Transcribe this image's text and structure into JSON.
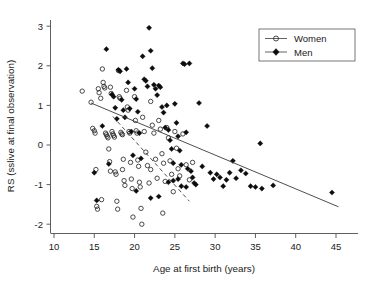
{
  "chart_data": {
    "type": "scatter",
    "title": "",
    "xlabel": "Age at first birth (years)",
    "ylabel": "RS (sslive at final observation)",
    "xlim": [
      9,
      47
    ],
    "ylim": [
      -2.35,
      3.2
    ],
    "xticks": [
      10,
      15,
      20,
      25,
      30,
      35,
      40,
      45
    ],
    "yticks": [
      -2,
      -1,
      0,
      1,
      2,
      3
    ],
    "grid": false,
    "legend_position": "top-right",
    "legend": [
      {
        "name": "Women",
        "marker": "open-circle"
      },
      {
        "name": "Men",
        "marker": "filled-diamond"
      }
    ],
    "series": [
      {
        "name": "Women",
        "marker": "open-circle",
        "points": [
          [
            13.5,
            1.36
          ],
          [
            14.6,
            1.08
          ],
          [
            14.8,
            0.42
          ],
          [
            15.0,
            0.36
          ],
          [
            15.1,
            0.3
          ],
          [
            15.2,
            -0.62
          ],
          [
            15.3,
            -1.55
          ],
          [
            15.4,
            -1.62
          ],
          [
            15.5,
            1.42
          ],
          [
            15.6,
            1.32
          ],
          [
            15.8,
            1.18
          ],
          [
            15.9,
            -1.38
          ],
          [
            16.0,
            1.92
          ],
          [
            16.1,
            1.58
          ],
          [
            16.2,
            1.48
          ],
          [
            16.3,
            1.44
          ],
          [
            16.4,
            0.3
          ],
          [
            16.5,
            0.26
          ],
          [
            16.6,
            0.22
          ],
          [
            16.7,
            0.18
          ],
          [
            16.8,
            -0.1
          ],
          [
            16.9,
            -0.42
          ],
          [
            17.0,
            1.46
          ],
          [
            17.1,
            1.3
          ],
          [
            17.2,
            0.34
          ],
          [
            17.3,
            0.28
          ],
          [
            17.4,
            0.24
          ],
          [
            17.5,
            0.2
          ],
          [
            17.6,
            -0.68
          ],
          [
            17.7,
            -0.74
          ],
          [
            17.8,
            -1.42
          ],
          [
            17.9,
            -1.62
          ],
          [
            18.0,
            1.88
          ],
          [
            18.1,
            1.22
          ],
          [
            18.2,
            1.18
          ],
          [
            18.3,
            0.32
          ],
          [
            18.4,
            0.28
          ],
          [
            18.5,
            0.26
          ],
          [
            18.6,
            -0.36
          ],
          [
            18.7,
            -0.9
          ],
          [
            18.8,
            -1.02
          ],
          [
            19.0,
            1.38
          ],
          [
            19.1,
            0.96
          ],
          [
            19.2,
            0.88
          ],
          [
            19.3,
            0.34
          ],
          [
            19.4,
            0.3
          ],
          [
            19.5,
            -0.44
          ],
          [
            19.6,
            -0.86
          ],
          [
            19.7,
            -1.1
          ],
          [
            19.8,
            -1.82
          ],
          [
            20.0,
            1.22
          ],
          [
            20.1,
            0.62
          ],
          [
            20.2,
            0.36
          ],
          [
            20.3,
            0.3
          ],
          [
            20.4,
            -0.38
          ],
          [
            20.5,
            -0.54
          ],
          [
            20.6,
            -0.94
          ],
          [
            20.7,
            -1.06
          ],
          [
            20.8,
            -1.6
          ],
          [
            20.9,
            -2.0
          ],
          [
            21.0,
            0.7
          ],
          [
            21.2,
            0.34
          ],
          [
            21.4,
            -0.18
          ],
          [
            21.6,
            -0.52
          ],
          [
            21.8,
            -0.96
          ],
          [
            22.0,
            1.1
          ],
          [
            22.2,
            0.5
          ],
          [
            22.4,
            0.3
          ],
          [
            22.6,
            -0.36
          ],
          [
            22.8,
            -0.84
          ],
          [
            23.0,
            0.62
          ],
          [
            23.2,
            0.4
          ],
          [
            23.4,
            -0.22
          ],
          [
            23.6,
            -0.46
          ],
          [
            23.8,
            -0.92
          ],
          [
            24.0,
            0.44
          ],
          [
            24.2,
            0.18
          ],
          [
            24.4,
            -0.4
          ],
          [
            24.6,
            -0.74
          ],
          [
            24.8,
            -1.18
          ],
          [
            25.0,
            0.34
          ],
          [
            25.2,
            -0.08
          ],
          [
            25.4,
            -0.6
          ],
          [
            25.6,
            -0.78
          ],
          [
            26.0,
            0.28
          ],
          [
            26.4,
            -0.5
          ],
          [
            26.8,
            -0.88
          ],
          [
            27.2,
            -0.44
          ],
          [
            23.5,
            -1.72
          ],
          [
            22.0,
            -0.62
          ],
          [
            18.5,
            -0.62
          ],
          [
            17.0,
            -0.66
          ]
        ]
      },
      {
        "name": "Men",
        "marker": "filled-diamond",
        "points": [
          [
            15.0,
            -0.7
          ],
          [
            15.3,
            -1.4
          ],
          [
            16.5,
            2.42
          ],
          [
            17.2,
            1.28
          ],
          [
            17.4,
            1.22
          ],
          [
            17.6,
            0.94
          ],
          [
            17.8,
            0.66
          ],
          [
            18.0,
            1.9
          ],
          [
            18.2,
            1.86
          ],
          [
            18.4,
            1.14
          ],
          [
            18.6,
            0.88
          ],
          [
            18.8,
            0.7
          ],
          [
            19.0,
            1.92
          ],
          [
            19.2,
            1.58
          ],
          [
            19.4,
            0.92
          ],
          [
            19.6,
            0.34
          ],
          [
            19.8,
            -0.26
          ],
          [
            20.0,
            1.42
          ],
          [
            20.2,
            1.16
          ],
          [
            20.4,
            0.84
          ],
          [
            20.6,
            0.3
          ],
          [
            20.8,
            -0.34
          ],
          [
            21.0,
            2.24
          ],
          [
            21.2,
            1.66
          ],
          [
            21.4,
            1.62
          ],
          [
            21.6,
            1.48
          ],
          [
            21.8,
            2.96
          ],
          [
            22.0,
            2.38
          ],
          [
            22.2,
            1.94
          ],
          [
            22.4,
            1.52
          ],
          [
            22.6,
            1.42
          ],
          [
            22.8,
            1.26
          ],
          [
            23.0,
            1.5
          ],
          [
            23.2,
            1.46
          ],
          [
            23.4,
            0.96
          ],
          [
            23.6,
            0.82
          ],
          [
            23.8,
            0.44
          ],
          [
            24.0,
            1.0
          ],
          [
            24.2,
            0.38
          ],
          [
            24.4,
            0.12
          ],
          [
            24.6,
            -0.1
          ],
          [
            24.8,
            -0.46
          ],
          [
            25.0,
            1.04
          ],
          [
            25.2,
            0.56
          ],
          [
            25.4,
            0.22
          ],
          [
            25.6,
            -0.14
          ],
          [
            25.8,
            -0.5
          ],
          [
            26.0,
            2.06
          ],
          [
            26.2,
            2.04
          ],
          [
            26.4,
            0.32
          ],
          [
            26.6,
            -0.6
          ],
          [
            26.8,
            2.06
          ],
          [
            27.0,
            -0.66
          ],
          [
            27.2,
            -0.82
          ],
          [
            27.4,
            -0.96
          ],
          [
            27.6,
            -1.0
          ],
          [
            28.0,
            1.06
          ],
          [
            28.4,
            -0.54
          ],
          [
            29.0,
            0.48
          ],
          [
            29.4,
            -0.7
          ],
          [
            29.8,
            -0.86
          ],
          [
            30.2,
            -0.74
          ],
          [
            30.6,
            -0.82
          ],
          [
            31.0,
            -1.04
          ],
          [
            31.4,
            -0.88
          ],
          [
            31.8,
            -0.7
          ],
          [
            32.2,
            -0.4
          ],
          [
            32.6,
            -0.84
          ],
          [
            33.2,
            -0.64
          ],
          [
            33.8,
            -0.72
          ],
          [
            34.4,
            -1.04
          ],
          [
            35.0,
            -1.06
          ],
          [
            35.6,
            0.04
          ],
          [
            35.8,
            -1.1
          ],
          [
            37.2,
            -1.02
          ],
          [
            44.5,
            -1.2
          ],
          [
            22.0,
            -1.34
          ],
          [
            23.0,
            -1.3
          ],
          [
            24.2,
            -0.94
          ],
          [
            24.8,
            -0.9
          ],
          [
            25.4,
            -0.86
          ],
          [
            25.8,
            -1.04
          ],
          [
            26.4,
            -1.06
          ],
          [
            20.2,
            -1.16
          ],
          [
            16.0,
            0.48
          ],
          [
            16.8,
            -0.48
          ]
        ]
      }
    ],
    "fit_lines": [
      {
        "name": "Men fit (solid)",
        "style": "solid",
        "x_start": 14.6,
        "y_start": 1.06,
        "x_end": 45.3,
        "y_end": -1.56
      },
      {
        "name": "Women fit (dashed)",
        "style": "dashed",
        "x_start": 17.3,
        "y_start": 0.72,
        "x_end": 26.8,
        "y_end": -1.42
      }
    ]
  }
}
